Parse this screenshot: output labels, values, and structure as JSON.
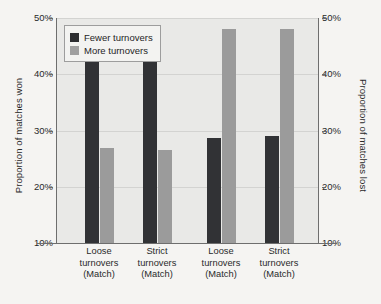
{
  "chart_data": {
    "type": "bar",
    "title": "",
    "subtitle": "",
    "xlabel": "",
    "ylabel": "Proportion of matches won",
    "ylabel_right": "Proportion of matches lost",
    "ylim": [
      10,
      50
    ],
    "ytick_labels": [
      "50%",
      "40%",
      "30%",
      "20%",
      "10%"
    ],
    "ytick_values": [
      50,
      40,
      30,
      20,
      10
    ],
    "ytick_labels_right": [
      "50%",
      "40%",
      "30%",
      "20%",
      "10%"
    ],
    "grid": true,
    "legend_position": "top-left",
    "categories": [
      "Loose turnovers (Match)",
      "Strict turnovers (Match)",
      "Loose turnovers (Match)",
      "Strict turnovers (Match)"
    ],
    "category_lines": [
      [
        "Loose",
        "turnovers",
        "(Match)"
      ],
      [
        "Strict",
        "turnovers",
        "(Match)"
      ],
      [
        "Loose",
        "turnovers",
        "(Match)"
      ],
      [
        "Strict",
        "turnovers",
        "(Match)"
      ]
    ],
    "series": [
      {
        "name": "Fewer turnovers",
        "color": "#313235",
        "values": [
          44.2,
          44.2,
          28.7,
          29.0
        ]
      },
      {
        "name": "More turnovers",
        "color": "#9b9b9b",
        "values": [
          26.9,
          26.6,
          48.0,
          48.0
        ]
      }
    ]
  },
  "legend": {
    "items": [
      {
        "label": "Fewer turnovers",
        "swatch": "dark"
      },
      {
        "label": "More turnovers",
        "swatch": "light"
      }
    ]
  },
  "colors": {
    "page_background": "#f5f4f2",
    "plot_background": "#e9e9e7",
    "axis": "#6e6e6e",
    "gridline": "#d3d3d1",
    "series_dark": "#313235",
    "series_light": "#9b9b9b",
    "text": "#2a2a2a"
  }
}
